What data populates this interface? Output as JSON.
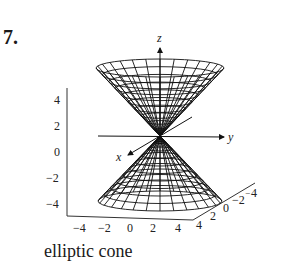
{
  "problem_number": "7.",
  "caption": "elliptic cone",
  "chart_data": {
    "type": "surface3d",
    "title": "",
    "surface": "elliptic cone z^2 = x^2 + y^2 (double cone, apex at origin)",
    "axes": {
      "x": {
        "label": "x",
        "ticks": [
          "4",
          "2",
          "0",
          "-2",
          "-4"
        ],
        "range": [
          -4,
          4
        ]
      },
      "y": {
        "label": "y",
        "ticks": [
          "-4",
          "-2",
          "0",
          "2",
          "4"
        ],
        "range": [
          -4,
          4
        ]
      },
      "z": {
        "label": "z",
        "ticks": [
          "4",
          "2",
          "0",
          "-2",
          "-4"
        ],
        "range": [
          -4,
          4
        ]
      }
    },
    "box_z_ticks": [
      "4",
      "2",
      "0",
      "−2",
      "−4"
    ],
    "box_bottom_ticks": [
      "−4",
      "−2",
      "0",
      "2",
      "4"
    ],
    "box_depth_ticks": [
      "4",
      "2",
      "0",
      "−2",
      "−4"
    ],
    "mesh": "wireframe grid",
    "grid": false
  }
}
